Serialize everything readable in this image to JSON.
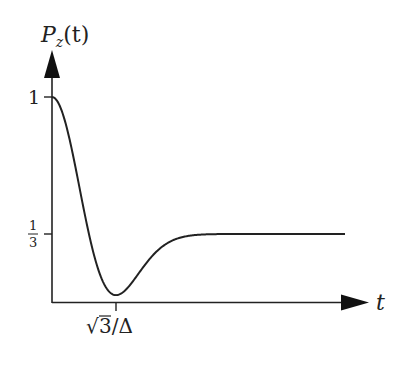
{
  "chart_data": {
    "type": "line",
    "title": "",
    "ylabel": "P_z(t)",
    "xlabel": "t",
    "y_ticks": [
      {
        "value": 1,
        "label": "1"
      },
      {
        "value": 0.3333,
        "label": "1/3"
      }
    ],
    "x_ticks": [
      {
        "value": 1.732,
        "label": "√3/Δ"
      }
    ],
    "xlim": [
      0,
      8.9
    ],
    "ylim": [
      0,
      1.2
    ],
    "grid": false,
    "legend": null,
    "function": "P_z(t) = 1/3 + 2/3 (1 - Δ²t²) exp(-Δ²t²/2), Δ = 1",
    "series": [
      {
        "name": "P_z(t)",
        "x": [
          0,
          0.5,
          1.0,
          1.5,
          1.732,
          2.0,
          2.5,
          3.0,
          3.5,
          4.0,
          5.0,
          6.0,
          7.0,
          7.93
        ],
        "values": [
          1.0,
          0.921,
          0.333,
          0.053,
          0.036,
          0.061,
          0.198,
          0.298,
          0.327,
          0.332,
          0.3333,
          0.3333,
          0.3333,
          0.3333
        ]
      }
    ],
    "annotations": [
      {
        "text": "minimum at t = √3/Δ",
        "x": 1.732,
        "y": 0.036
      },
      {
        "text": "asymptote 1/3",
        "y": 0.3333
      }
    ]
  },
  "labels": {
    "y_axis_p": "P",
    "y_axis_sub": "z",
    "y_axis_rest": "(t)",
    "x_axis": "t",
    "tick_y_one": "1",
    "tick_y_third_num": "1",
    "tick_y_third_den": "3",
    "tick_x_sqrt": "√",
    "tick_x_rest": "3/Δ"
  }
}
